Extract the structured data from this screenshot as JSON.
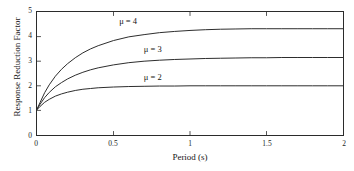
{
  "chart_data": {
    "type": "line",
    "title": "",
    "xlabel": "Period (s)",
    "ylabel": "Response Reduction Factor",
    "xlim": [
      0,
      2
    ],
    "ylim": [
      0,
      5
    ],
    "xticks": [
      0,
      0.5,
      1,
      1.5,
      2
    ],
    "xticklabels": [
      "0",
      "0.5",
      "1",
      "1.5",
      "2"
    ],
    "yticks": [
      0,
      1,
      2,
      3,
      4,
      5
    ],
    "yticklabels": [
      "0",
      "1",
      "2",
      "3",
      "4",
      "5"
    ],
    "grid": false,
    "legend": "inline-annotations",
    "x": [
      0,
      0.02,
      0.05,
      0.08,
      0.12,
      0.16,
      0.2,
      0.25,
      0.3,
      0.35,
      0.4,
      0.5,
      0.6,
      0.7,
      0.8,
      0.9,
      1.0,
      1.1,
      1.2,
      1.3,
      1.4,
      1.5,
      1.6,
      1.7,
      1.8,
      1.9,
      2.0
    ],
    "series": [
      {
        "name": "mu = 4",
        "label": "μ = 4",
        "asymptote": 4.32,
        "color": "#2b2b2b",
        "values": [
          1.05,
          1.32,
          1.72,
          2.04,
          2.39,
          2.67,
          2.9,
          3.14,
          3.34,
          3.5,
          3.63,
          3.84,
          3.99,
          4.08,
          4.16,
          4.21,
          4.25,
          4.28,
          4.3,
          4.31,
          4.32,
          4.32,
          4.32,
          4.32,
          4.32,
          4.32,
          4.32
        ]
      },
      {
        "name": "mu = 3",
        "label": "μ = 3",
        "asymptote": 3.15,
        "color": "#2b2b2b",
        "values": [
          1.04,
          1.25,
          1.52,
          1.73,
          1.96,
          2.13,
          2.28,
          2.43,
          2.55,
          2.65,
          2.73,
          2.85,
          2.94,
          3.0,
          3.04,
          3.07,
          3.09,
          3.11,
          3.12,
          3.13,
          3.14,
          3.14,
          3.15,
          3.15,
          3.15,
          3.15,
          3.15
        ]
      },
      {
        "name": "mu = 2",
        "label": "μ = 2",
        "asymptote": 2.0,
        "color": "#2b2b2b",
        "values": [
          1.03,
          1.16,
          1.33,
          1.45,
          1.58,
          1.67,
          1.74,
          1.81,
          1.86,
          1.89,
          1.92,
          1.95,
          1.97,
          1.98,
          1.99,
          1.99,
          2.0,
          2.0,
          2.0,
          2.0,
          2.0,
          2.0,
          2.0,
          2.0,
          2.0,
          2.0,
          2.0
        ]
      }
    ],
    "annotations": [
      {
        "text": "μ = 4",
        "x": 0.54,
        "y": 4.62
      },
      {
        "text": "μ = 3",
        "x": 0.7,
        "y": 3.48
      },
      {
        "text": "μ = 2",
        "x": 0.7,
        "y": 2.35
      }
    ]
  },
  "axes": {
    "xlabel": "Period (s)",
    "ylabel": "Response Reduction Factor",
    "xticklabels": [
      "0",
      "0.5",
      "1",
      "1.5",
      "2"
    ],
    "yticklabels": [
      "0",
      "1",
      "2",
      "3",
      "4",
      "5"
    ]
  },
  "style": {
    "axis_color": "#2b2b2b",
    "curve_color": "#2b2b2b",
    "text_color": "#151515",
    "background": "#ffffff"
  }
}
